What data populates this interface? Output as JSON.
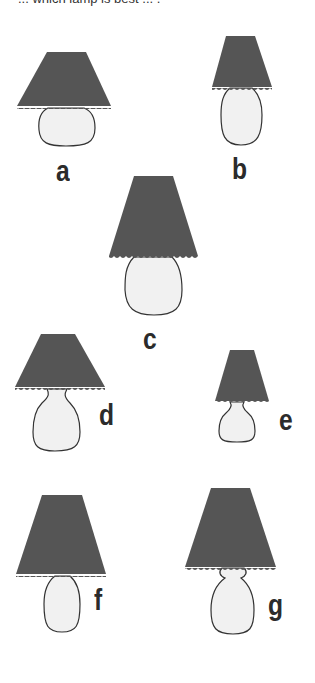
{
  "header": {
    "cropped_text": "... which lamp is best ... ."
  },
  "colors": {
    "shade": "#555555",
    "base_fill": "#f1f1f1",
    "outline": "#333333",
    "label": "#2b2b2b"
  },
  "lamps": [
    {
      "id": "a",
      "label": "a"
    },
    {
      "id": "b",
      "label": "b"
    },
    {
      "id": "c",
      "label": "c"
    },
    {
      "id": "d",
      "label": "d"
    },
    {
      "id": "e",
      "label": "e"
    },
    {
      "id": "f",
      "label": "f"
    },
    {
      "id": "g",
      "label": "g"
    }
  ]
}
